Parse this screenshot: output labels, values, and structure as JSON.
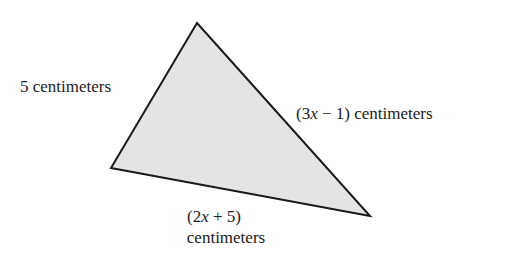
{
  "figure": {
    "shape": "triangle",
    "fill": "#e4e4e4",
    "stroke": "#1a1a1a",
    "vertices": {
      "top": [
        197,
        23
      ],
      "left": [
        111,
        168
      ],
      "right": [
        370,
        216
      ]
    },
    "labels": {
      "left_side": "5 centimeters",
      "right_side_expr_open": "(3",
      "right_side_var": "x",
      "right_side_expr_rest": " − 1) centimeters",
      "bottom_side_expr_open": "(2",
      "bottom_side_var": "x",
      "bottom_side_expr_rest": " + 5)",
      "bottom_side_unit": "centimeters"
    }
  }
}
